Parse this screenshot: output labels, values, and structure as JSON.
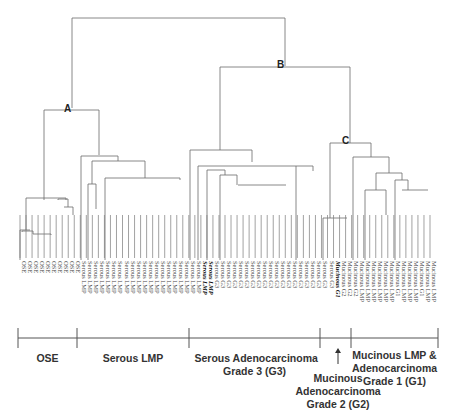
{
  "node_labels": {
    "A": "A",
    "B": "B",
    "C": "C"
  },
  "groups": [
    {
      "id": "ose",
      "label": "OSE",
      "start": 18,
      "end": 77
    },
    {
      "id": "serous-lmp",
      "label": "Serous LMP",
      "start": 77,
      "end": 189
    },
    {
      "id": "serous-g3",
      "label": "Serous Adenocarcinoma\nGrade 3 (G3)",
      "start": 189,
      "end": 320
    },
    {
      "id": "mucinous-g2",
      "label": "Mucinous\nAdenocarcinoma\nGrade 2 (G2)",
      "start": 320,
      "end": 351
    },
    {
      "id": "mucinous-lmp-g1",
      "label": "Mucinous LMP &\nAdenocarcinoma\nGrade 1 (G1)",
      "start": 351,
      "end": 438
    }
  ],
  "leaves": [
    "OSE",
    "OSE",
    "OSE",
    "OSE",
    "OSE",
    "OSE",
    "OSE",
    "OSE",
    "OSE",
    "OSE",
    "Serous LMP",
    "Serous LMP",
    "Serous LMP",
    "Serous LMP",
    "Serous LMP",
    "Serous LMP",
    "Serous LMP",
    "Serous LMP",
    "Serous LMP",
    "Serous LMP",
    "Serous LMP",
    "Serous LMP",
    "Serous LMP",
    "Serous LMP",
    "Serous LMP",
    "Serous LMP",
    "Serous LMP",
    "Serous LMP",
    "Serous LMP",
    "Serous LMP",
    "Serous LMP",
    "Serous LMP",
    "Serous G3",
    "Serous G3",
    "Serous G3",
    "Serous G3",
    "Serous G3",
    "Serous G3",
    "Serous G3",
    "Serous G3",
    "Serous G3",
    "Serous G3",
    "Serous G3",
    "Serous G3",
    "Serous G3",
    "Serous G3",
    "Serous G3",
    "Serous G3",
    "Serous G3",
    "Serous G3",
    "Serous G3",
    "Serous G3",
    "Mucinous G1",
    "Mucinous G2",
    "Mucinous G2",
    "Mucinous G2",
    "Mucinous LMP",
    "Mucinous LMP",
    "Mucinous LMP",
    "Mucinous LMP",
    "Mucinous LMP",
    "Mucinous LMP",
    "Mucinous G1",
    "Mucinous LMP",
    "Mucinous LMP",
    "Mucinous LMP",
    "Mucinous G1",
    "Mucinous LMP",
    "Mucinous LMP"
  ],
  "bold_leaf_indices": [
    30,
    31,
    52
  ],
  "arrow_target": "mucinous-g2",
  "colors": {
    "line": "#555555",
    "text": "#333333"
  }
}
